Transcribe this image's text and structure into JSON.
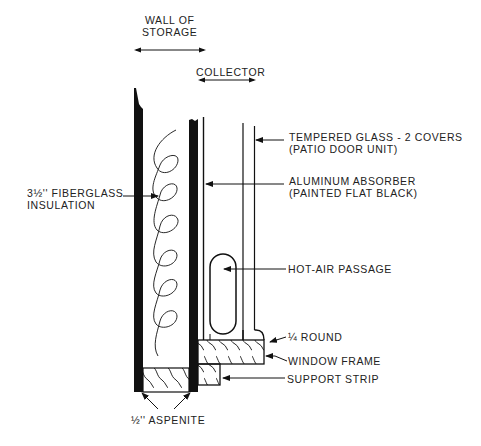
{
  "diagram": {
    "type": "cross-section",
    "headers": {
      "wall_of_storage": {
        "line1": "WALL OF",
        "line2": "STORAGE"
      },
      "collector": "COLLECTOR"
    },
    "labels": {
      "tempered_glass": {
        "line1": "TEMPERED GLASS - 2 COVERS",
        "line2": "(PATIO DOOR UNIT)"
      },
      "aluminum_absorber": {
        "line1": "ALUMINUM ABSORBER",
        "line2": "(PAINTED FLAT BLACK)"
      },
      "fiberglass_insulation": {
        "line1": "3½'' FIBERGLASS",
        "line2": "INSULATION"
      },
      "hot_air_passage": "HOT-AIR PASSAGE",
      "quarter_round": "¼ ROUND",
      "window_frame": "WINDOW FRAME",
      "support_strip": "SUPPORT STRIP",
      "aspenite": "½'' ASPENITE"
    },
    "colors": {
      "ink": "#111111",
      "background": "#ffffff"
    }
  }
}
